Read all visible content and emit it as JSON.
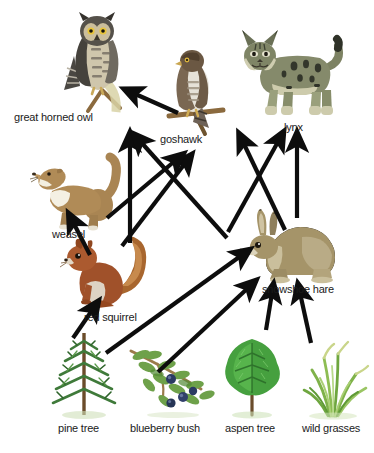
{
  "diagram": {
    "type": "food-web",
    "background": "#ffffff",
    "arrow_color": "#0d0d0d",
    "label_color": "#1b1b1b",
    "width": 374,
    "height": 453
  },
  "nodes": [
    {
      "id": "great_horned_owl",
      "label": "great horned owl",
      "trophic": "tertiary consumer",
      "label_x": 14,
      "label_y": 111,
      "art_x": 58,
      "art_y": 12,
      "art_w": 78,
      "art_h": 98,
      "colors": {
        "body": "#8f8674",
        "dark": "#3c3a36",
        "light": "#ded7c0",
        "beak": "#c8a94f"
      }
    },
    {
      "id": "goshawk",
      "label": "goshawk",
      "trophic": "tertiary consumer",
      "label_x": 160,
      "label_y": 133,
      "art_x": 165,
      "art_y": 48,
      "art_w": 60,
      "art_h": 85,
      "colors": {
        "body": "#7d6a55",
        "dark": "#4a3c2e",
        "light": "#e8e4dc",
        "beak": "#d3b765"
      }
    },
    {
      "id": "lynx",
      "label": "lynx",
      "trophic": "tertiary consumer",
      "label_x": 284,
      "label_y": 121,
      "art_x": 232,
      "art_y": 26,
      "art_w": 110,
      "art_h": 92,
      "colors": {
        "body": "#7d8263",
        "dark": "#2f3228",
        "light": "#cdcbac",
        "belly": "#d9d6ba"
      }
    },
    {
      "id": "weasel",
      "label": "weasel",
      "trophic": "secondary consumer",
      "label_x": 52,
      "label_y": 228,
      "art_x": 30,
      "art_y": 155,
      "art_w": 88,
      "art_h": 72,
      "colors": {
        "body": "#a07a4c",
        "dark": "#6d4e2c",
        "light": "#f3efe2"
      }
    },
    {
      "id": "red_squirrel",
      "label": "red squirrel",
      "trophic": "primary consumer",
      "label_x": 84,
      "label_y": 311,
      "art_x": 60,
      "art_y": 232,
      "art_w": 90,
      "art_h": 78,
      "colors": {
        "body": "#a0512a",
        "dark": "#6b3518",
        "light": "#ddd3c4"
      }
    },
    {
      "id": "snowshoe_hare",
      "label": "snowshoe hare",
      "trophic": "primary consumer",
      "label_x": 262,
      "label_y": 283,
      "art_x": 240,
      "art_y": 207,
      "art_w": 98,
      "art_h": 75,
      "colors": {
        "body": "#a0906e",
        "dark": "#6a5b42",
        "light": "#e4dcc7"
      }
    },
    {
      "id": "pine_tree",
      "label": "pine tree",
      "trophic": "producer",
      "label_x": 58,
      "label_y": 422,
      "art_x": 47,
      "art_y": 331,
      "art_w": 72,
      "art_h": 85,
      "colors": {
        "foliage": "#3f7a3a",
        "dark": "#255222",
        "trunk": "#6b4c2a"
      }
    },
    {
      "id": "blueberry_bush",
      "label": "blueberry bush",
      "trophic": "producer",
      "label_x": 130,
      "label_y": 422,
      "art_x": 127,
      "art_y": 345,
      "art_w": 88,
      "art_h": 70,
      "colors": {
        "foliage": "#6ea14a",
        "berry": "#2b3a63",
        "stem": "#9a7b4a"
      }
    },
    {
      "id": "aspen_tree",
      "label": "aspen tree",
      "trophic": "producer",
      "label_x": 225,
      "label_y": 422,
      "art_x": 215,
      "art_y": 337,
      "art_w": 72,
      "art_h": 80,
      "colors": {
        "foliage": "#46a03f",
        "dark": "#2a6b28",
        "trunk": "#6a4c2b"
      }
    },
    {
      "id": "wild_grasses",
      "label": "wild grasses",
      "trophic": "producer",
      "label_x": 302,
      "label_y": 422,
      "art_x": 294,
      "art_y": 340,
      "art_w": 76,
      "art_h": 78,
      "colors": {
        "blade": "#7fb24a",
        "dark": "#4f7f2c",
        "pale": "#c9d58a"
      }
    }
  ],
  "links": [
    {
      "from": "goshawk",
      "to": "great_horned_owl",
      "x1": 178,
      "y1": 113,
      "x2": 133,
      "y2": 93
    },
    {
      "from": "red_squirrel",
      "to": "great_horned_owl",
      "x1": 130,
      "y1": 243,
      "x2": 130,
      "y2": 142
    },
    {
      "from": "snowshoe_hare",
      "to": "great_horned_owl",
      "x1": 227,
      "y1": 238,
      "x2": 140,
      "y2": 141
    },
    {
      "from": "red_squirrel",
      "to": "goshawk",
      "x1": 122,
      "y1": 246,
      "x2": 186,
      "y2": 162
    },
    {
      "from": "weasel",
      "to": "goshawk",
      "x1": 107,
      "y1": 218,
      "x2": 176,
      "y2": 160
    },
    {
      "from": "snowshoe_hare",
      "to": "lynx",
      "x1": 297,
      "y1": 218,
      "x2": 297,
      "y2": 142
    },
    {
      "from": "red_squirrel",
      "to": "lynx",
      "x1": 228,
      "y1": 232,
      "x2": 279,
      "y2": 140
    },
    {
      "from": "weasel",
      "to": "lynx",
      "x1": 285,
      "y1": 230,
      "x2": 243,
      "y2": 142
    },
    {
      "from": "red_squirrel",
      "to": "weasel",
      "x1": 90,
      "y1": 255,
      "x2": 73,
      "y2": 222
    },
    {
      "from": "pine_tree",
      "to": "red_squirrel",
      "x1": 73,
      "y1": 338,
      "x2": 93,
      "y2": 309
    },
    {
      "from": "pine_tree",
      "to": "snowshoe_hare",
      "x1": 106,
      "y1": 353,
      "x2": 242,
      "y2": 255
    },
    {
      "from": "blueberry_bush",
      "to": "snowshoe_hare",
      "x1": 158,
      "y1": 372,
      "x2": 249,
      "y2": 287
    },
    {
      "from": "aspen_tree",
      "to": "snowshoe_hare",
      "x1": 266,
      "y1": 330,
      "x2": 272,
      "y2": 293
    },
    {
      "from": "wild_grasses",
      "to": "snowshoe_hare",
      "x1": 311,
      "y1": 343,
      "x2": 300,
      "y2": 293
    }
  ]
}
